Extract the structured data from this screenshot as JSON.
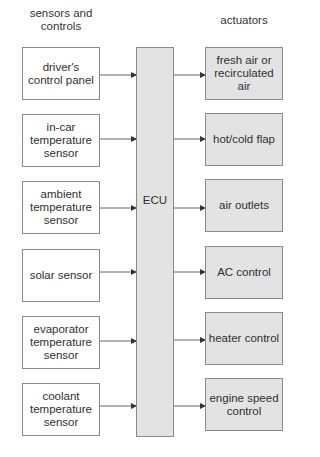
{
  "headings": {
    "left": "sensors and controls",
    "left_line1": "sensors and",
    "left_line2": "controls",
    "right": "actuators"
  },
  "ecu": {
    "label": "ECU"
  },
  "sensors": [
    {
      "label": "driver's control panel"
    },
    {
      "label": "in-car temperature sensor"
    },
    {
      "label": "ambient temperature sensor"
    },
    {
      "label": "solar sensor"
    },
    {
      "label": "evaporator temperature sensor"
    },
    {
      "label": "coolant temperature sensor"
    }
  ],
  "actuators": [
    {
      "label": "fresh air or recirculated air"
    },
    {
      "label": "hot/cold flap"
    },
    {
      "label": "air outlets"
    },
    {
      "label": "AC control"
    },
    {
      "label": "heater control"
    },
    {
      "label": "engine speed control"
    }
  ],
  "colors": {
    "box_border": "#8a8a8a",
    "actuator_fill": "#e3e3e3",
    "ecu_fill": "#e3e3e3",
    "sensor_fill": "#ffffff",
    "arrow": "#555555"
  }
}
